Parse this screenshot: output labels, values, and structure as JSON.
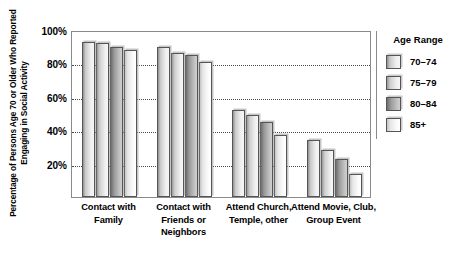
{
  "chart_data": {
    "type": "bar",
    "title": "",
    "xlabel": "",
    "ylabel": "Percentage of Persons Age 70 or Older Who Reported Engaging in Social Activity",
    "ylim": [
      0,
      100
    ],
    "ytick_labels": [
      "100%",
      "80%",
      "60%",
      "40%",
      "20%"
    ],
    "ytick_values": [
      100,
      80,
      60,
      40,
      20
    ],
    "gridlines": [
      80,
      60,
      40,
      20
    ],
    "grid": true,
    "legend_position": "right",
    "legend_title": "Age Range",
    "categories": [
      "Contact with Family",
      "Contact with Friends or Neighbors",
      "Attend Church, Temple, other",
      "Attend Movie, Club, Group Event"
    ],
    "category_lines": [
      [
        "Contact with",
        "Family"
      ],
      [
        "Contact with",
        "Friends or",
        "Neighbors"
      ],
      [
        "Attend Church,",
        "Temple, other"
      ],
      [
        "Attend Movie, Club,",
        "Group Event"
      ]
    ],
    "series": [
      {
        "name": "70–74",
        "values": [
          93,
          90,
          52,
          34
        ]
      },
      {
        "name": "75–79",
        "values": [
          92,
          86,
          49,
          28
        ]
      },
      {
        "name": "80–84",
        "values": [
          90,
          85,
          45,
          23
        ]
      },
      {
        "name": "85+",
        "values": [
          88,
          81,
          37,
          14
        ]
      }
    ]
  },
  "legend": {
    "title": "Age Range",
    "items": [
      {
        "label": "70–74"
      },
      {
        "label": "75–79"
      },
      {
        "label": "80–84"
      },
      {
        "label": "85+"
      }
    ]
  },
  "axis": {
    "y_title": "Percentage of Persons Age 70 or Older Who Reported Engaging in Social Activity"
  }
}
